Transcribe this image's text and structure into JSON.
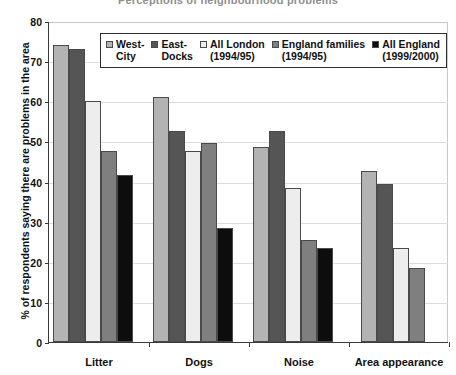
{
  "chart_data": {
    "type": "bar",
    "title": "Perceptions of neighbourhood problems",
    "xlabel": "",
    "ylabel": "% of respondents saying there are problems in the area",
    "ylim": [
      0,
      80
    ],
    "yticks": [
      0,
      10,
      20,
      30,
      40,
      50,
      60,
      70,
      80
    ],
    "grid": true,
    "legend_position": "upper-center-inside",
    "categories": [
      "Litter",
      "Dogs",
      "Noise",
      "Area appearance"
    ],
    "series": [
      {
        "name": "West-\nCity",
        "color": "#b3b3b3",
        "values": [
          74,
          61,
          48.5,
          42.5
        ]
      },
      {
        "name": "East-\nDocks",
        "color": "#555555",
        "values": [
          73,
          52.5,
          52.5,
          39.5
        ]
      },
      {
        "name": "All London\n(1994/95)",
        "color": "#ededed",
        "values": [
          60,
          47.5,
          38.5,
          23.5
        ]
      },
      {
        "name": "England families\n(1994/95)",
        "color": "#7f7f7f",
        "values": [
          47.5,
          49.5,
          25.5,
          18.5
        ]
      },
      {
        "name": "All England\n(1999/2000)",
        "color": "#0d0d0d",
        "values": [
          41.5,
          28.5,
          23.5,
          null
        ]
      }
    ]
  }
}
